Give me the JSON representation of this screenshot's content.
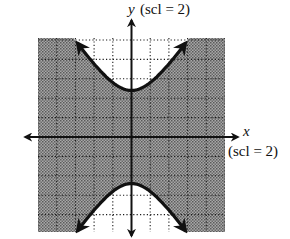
{
  "chart_data": {
    "type": "line",
    "title": "",
    "subtitle": "Graph of a shaded inequality bounded by a vertical hyperbola",
    "xlabel": "x",
    "ylabel": "y",
    "x_scale_label": "(scl = 2)",
    "y_scale_label": "(scl = 2)",
    "xlim": [
      -10,
      10
    ],
    "ylim": [
      -10,
      10
    ],
    "x_scale": 2,
    "y_scale": 2,
    "grid": true,
    "grid_style": "dotted",
    "legend": null,
    "series": [
      {
        "name": "hyperbola boundary (estimated)",
        "kind": "vertical hyperbola y^2/a^2 - x^2/b^2 = 1",
        "center": [
          0,
          0
        ],
        "a": 4.8,
        "b": 3.3,
        "vertices": [
          [
            0,
            4.8
          ],
          [
            0,
            -4.8
          ]
        ],
        "line_style": "solid",
        "x_range": [
          -5.8,
          5.8
        ],
        "arrows_at_ends": true
      }
    ],
    "shaded_region": "region between the two branches (outside the hyperbola), |y| < boundary",
    "unshaded_region": "inside each branch (above upper branch, below lower branch)",
    "colors": {
      "shade": "#8a8a8a",
      "curve": "#111111",
      "axis": "#111111",
      "grid": "#1a1a1a",
      "background": "#ffffff"
    }
  },
  "labels": {
    "y_axis": "y",
    "y_scl": "(scl = 2)",
    "x_axis": "x",
    "x_scl": "(scl = 2)"
  }
}
